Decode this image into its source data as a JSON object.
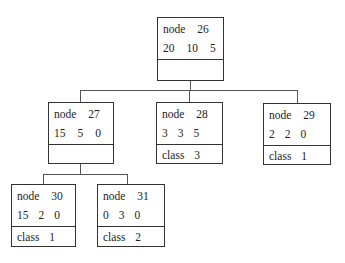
{
  "diagram": {
    "type": "decision-tree",
    "nodes": [
      {
        "id": "26",
        "label": "node",
        "number": "26",
        "counts": [
          "20",
          "10",
          "5"
        ],
        "class_label": "",
        "class_value": ""
      },
      {
        "id": "27",
        "label": "node",
        "number": "27",
        "counts": [
          "15",
          "5",
          "0"
        ],
        "class_label": "",
        "class_value": ""
      },
      {
        "id": "28",
        "label": "node",
        "number": "28",
        "counts": [
          "3",
          "3",
          "5"
        ],
        "class_label": "class",
        "class_value": "3"
      },
      {
        "id": "29",
        "label": "node",
        "number": "29",
        "counts": [
          "2",
          "2",
          "0"
        ],
        "class_label": "class",
        "class_value": "1"
      },
      {
        "id": "30",
        "label": "node",
        "number": "30",
        "counts": [
          "15",
          "2",
          "0"
        ],
        "class_label": "class",
        "class_value": "1"
      },
      {
        "id": "31",
        "label": "node",
        "number": "31",
        "counts": [
          "0",
          "3",
          "0"
        ],
        "class_label": "class",
        "class_value": "2"
      }
    ],
    "edges": [
      {
        "from": "26",
        "to": "27"
      },
      {
        "from": "26",
        "to": "28"
      },
      {
        "from": "26",
        "to": "29"
      },
      {
        "from": "27",
        "to": "30"
      },
      {
        "from": "27",
        "to": "31"
      }
    ]
  }
}
